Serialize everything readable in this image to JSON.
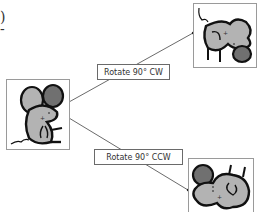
{
  "fragments": {
    "paren": ")",
    "dash": "-"
  },
  "edges": [
    {
      "label": "Rotate 90° CW"
    },
    {
      "label": "Rotate 90° CCW"
    }
  ],
  "nodes": {
    "source": {
      "name": "mouse-original"
    },
    "cw": {
      "name": "mouse-rotated-cw"
    },
    "ccw": {
      "name": "mouse-rotated-ccw"
    }
  },
  "colors": {
    "mouse_body": "#b3b3b3",
    "mouse_ear": "#707070",
    "outline": "#111111",
    "line": "#444444"
  }
}
